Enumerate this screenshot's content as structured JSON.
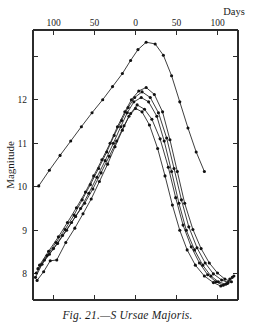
{
  "caption": "Fig. 21.—S Ursae Majoris.",
  "chart_data": {
    "type": "line",
    "title": "",
    "subtitle": "",
    "xlabel": "Days",
    "ylabel": "Magnitude",
    "grid": false,
    "legend_position": "none",
    "x_axis": {
      "label": "Days",
      "position": "top",
      "tick_labels": [
        "100",
        "50",
        "0",
        "50",
        "100"
      ],
      "tick_values": [
        -100,
        -50,
        0,
        50,
        100
      ],
      "xlim": [
        -125,
        125
      ],
      "note": "days before and after minimum; values increase away from zero on both sides"
    },
    "y_axis": {
      "label": "Magnitude",
      "position": "left",
      "inverted": true,
      "tick_labels": [
        "8",
        "9",
        "10",
        "11",
        "12",
        ""
      ],
      "tick_values": [
        8,
        9,
        10,
        11,
        12,
        13
      ],
      "ylim": [
        13.6,
        7.4
      ]
    },
    "series": [
      {
        "name": "cycle-1",
        "points": [
          [
            -120,
            7.85
          ],
          [
            -112,
            8.05
          ],
          [
            -104,
            8.3
          ],
          [
            -96,
            8.32
          ],
          [
            -85,
            8.72
          ],
          [
            -74,
            9.05
          ],
          [
            -64,
            9.38
          ],
          [
            -54,
            9.72
          ],
          [
            -44,
            10.12
          ],
          [
            -34,
            10.52
          ],
          [
            -25,
            10.92
          ],
          [
            -16,
            11.3
          ],
          [
            -8,
            11.62
          ],
          [
            0,
            11.8
          ],
          [
            8,
            11.72
          ],
          [
            17,
            11.42
          ],
          [
            27,
            10.88
          ],
          [
            36,
            10.25
          ],
          [
            45,
            9.58
          ],
          [
            54,
            9.0
          ],
          [
            63,
            8.55
          ],
          [
            73,
            8.2
          ],
          [
            84,
            7.95
          ],
          [
            95,
            7.8
          ],
          [
            104,
            7.72
          ],
          [
            112,
            7.78
          ]
        ]
      },
      {
        "name": "cycle-2",
        "points": [
          [
            -122,
            7.92
          ],
          [
            -114,
            8.22
          ],
          [
            -105,
            8.45
          ],
          [
            -95,
            8.7
          ],
          [
            -84,
            9.0
          ],
          [
            -73,
            9.32
          ],
          [
            -62,
            9.62
          ],
          [
            -52,
            9.95
          ],
          [
            -42,
            10.32
          ],
          [
            -32,
            10.7
          ],
          [
            -23,
            11.05
          ],
          [
            -14,
            11.4
          ],
          [
            -6,
            11.68
          ],
          [
            2,
            11.88
          ],
          [
            11,
            11.78
          ],
          [
            20,
            11.55
          ],
          [
            30,
            11.1
          ],
          [
            40,
            10.45
          ],
          [
            49,
            9.75
          ],
          [
            58,
            9.12
          ],
          [
            68,
            8.62
          ],
          [
            78,
            8.25
          ],
          [
            88,
            7.98
          ],
          [
            98,
            7.82
          ],
          [
            107,
            7.74
          ],
          [
            115,
            7.88
          ]
        ]
      },
      {
        "name": "cycle-3",
        "points": [
          [
            -121,
            8.02
          ],
          [
            -111,
            8.32
          ],
          [
            -100,
            8.58
          ],
          [
            -89,
            8.88
          ],
          [
            -78,
            9.18
          ],
          [
            -67,
            9.5
          ],
          [
            -57,
            9.85
          ],
          [
            -47,
            10.22
          ],
          [
            -37,
            10.6
          ],
          [
            -27,
            11.0
          ],
          [
            -18,
            11.38
          ],
          [
            -10,
            11.7
          ],
          [
            -2,
            11.95
          ],
          [
            7,
            12.05
          ],
          [
            16,
            11.95
          ],
          [
            26,
            11.62
          ],
          [
            35,
            11.05
          ],
          [
            44,
            10.35
          ],
          [
            53,
            9.62
          ],
          [
            62,
            9.0
          ],
          [
            72,
            8.55
          ],
          [
            82,
            8.2
          ],
          [
            92,
            7.95
          ],
          [
            101,
            7.82
          ],
          [
            110,
            7.76
          ],
          [
            118,
            7.92
          ]
        ]
      },
      {
        "name": "cycle-4",
        "points": [
          [
            -119,
            8.12
          ],
          [
            -108,
            8.42
          ],
          [
            -97,
            8.72
          ],
          [
            -86,
            9.02
          ],
          [
            -75,
            9.35
          ],
          [
            -65,
            9.7
          ],
          [
            -55,
            10.05
          ],
          [
            -45,
            10.42
          ],
          [
            -35,
            10.8
          ],
          [
            -26,
            11.18
          ],
          [
            -17,
            11.52
          ],
          [
            -9,
            11.82
          ],
          [
            -1,
            12.05
          ],
          [
            8,
            12.18
          ],
          [
            18,
            12.05
          ],
          [
            28,
            11.7
          ],
          [
            38,
            11.12
          ],
          [
            47,
            10.42
          ],
          [
            56,
            9.7
          ],
          [
            65,
            9.08
          ],
          [
            75,
            8.6
          ],
          [
            85,
            8.25
          ],
          [
            95,
            8.0
          ],
          [
            105,
            7.86
          ],
          [
            113,
            7.8
          ],
          [
            120,
            7.95
          ]
        ]
      },
      {
        "name": "cycle-5",
        "points": [
          [
            -117,
            8.2
          ],
          [
            -106,
            8.52
          ],
          [
            -94,
            8.85
          ],
          [
            -83,
            9.18
          ],
          [
            -72,
            9.52
          ],
          [
            -61,
            9.88
          ],
          [
            -51,
            10.25
          ],
          [
            -41,
            10.62
          ],
          [
            -31,
            11.0
          ],
          [
            -22,
            11.38
          ],
          [
            -13,
            11.72
          ],
          [
            -5,
            12.0
          ],
          [
            4,
            12.2
          ],
          [
            13,
            12.28
          ],
          [
            23,
            12.12
          ],
          [
            33,
            11.72
          ],
          [
            42,
            11.08
          ],
          [
            51,
            10.35
          ],
          [
            60,
            9.62
          ],
          [
            70,
            9.02
          ],
          [
            80,
            8.58
          ],
          [
            90,
            8.25
          ],
          [
            100,
            8.02
          ],
          [
            109,
            7.88
          ],
          [
            117,
            7.82
          ]
        ]
      },
      {
        "name": "faint-cycle",
        "points": [
          [
            -118,
            10.02
          ],
          [
            -105,
            10.38
          ],
          [
            -92,
            10.72
          ],
          [
            -79,
            11.05
          ],
          [
            -66,
            11.38
          ],
          [
            -53,
            11.7
          ],
          [
            -40,
            12.0
          ],
          [
            -28,
            12.3
          ],
          [
            -16,
            12.6
          ],
          [
            -6,
            12.9
          ],
          [
            3,
            13.15
          ],
          [
            13,
            13.32
          ],
          [
            24,
            13.28
          ],
          [
            34,
            13.02
          ],
          [
            44,
            12.55
          ],
          [
            54,
            11.95
          ],
          [
            64,
            11.35
          ],
          [
            74,
            10.8
          ],
          [
            84,
            10.35
          ]
        ]
      }
    ]
  }
}
